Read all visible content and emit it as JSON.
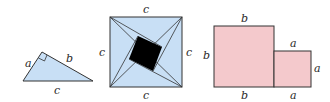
{
  "figure": {
    "colors": {
      "triangle_fill": "#c8dff5",
      "square_fill": "#c8dff5",
      "inner_square_fill": "#000000",
      "rect_fill": "#f4c9cc",
      "stroke": "#333333"
    },
    "triangle": {
      "labels": {
        "a": "a",
        "b": "b",
        "c": "c"
      }
    },
    "pinwheel_square": {
      "labels": {
        "top": "c",
        "left": "c",
        "right": "c",
        "bottom": "c"
      }
    },
    "two_squares": {
      "labels": {
        "big_top": "b",
        "big_left": "b",
        "big_bottom": "b",
        "small_top": "a",
        "small_right": "a",
        "small_bottom": "a"
      }
    }
  }
}
